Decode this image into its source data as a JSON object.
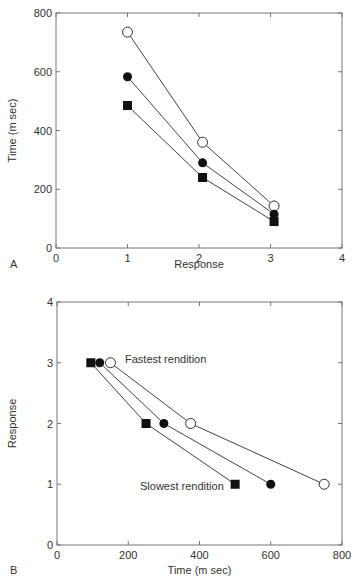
{
  "chart_data": [
    {
      "panel": "A",
      "type": "line",
      "xlabel": "Response",
      "ylabel": "Time (m sec)",
      "xlim": [
        0,
        4
      ],
      "ylim": [
        0,
        800
      ],
      "xticks": [
        "0",
        "1",
        "2",
        "3",
        "4"
      ],
      "yticks": [
        "0",
        "200",
        "400",
        "600",
        "800"
      ],
      "grid": false,
      "series": [
        {
          "name": "open-circle",
          "marker": "open-circle",
          "x": [
            1,
            2.05,
            3.05
          ],
          "y": [
            735,
            360,
            143
          ]
        },
        {
          "name": "filled-circle",
          "marker": "filled-circle",
          "x": [
            1,
            2.05,
            3.05
          ],
          "y": [
            583,
            290,
            115
          ]
        },
        {
          "name": "filled-square",
          "marker": "filled-square",
          "x": [
            1,
            2.05,
            3.05
          ],
          "y": [
            485,
            240,
            90
          ]
        }
      ]
    },
    {
      "panel": "B",
      "type": "line",
      "xlabel": "Time (m sec)",
      "ylabel": "Response",
      "xlim": [
        0,
        800
      ],
      "ylim": [
        0,
        4
      ],
      "xticks": [
        "0",
        "200",
        "400",
        "600",
        "800"
      ],
      "yticks": [
        "0",
        "1",
        "2",
        "3",
        "4"
      ],
      "grid": false,
      "annotations": [
        "Fastest rendition",
        "Slowest rendition"
      ],
      "series": [
        {
          "name": "filled-square",
          "marker": "filled-square",
          "x": [
            95,
            250,
            500
          ],
          "y": [
            3,
            2,
            1
          ]
        },
        {
          "name": "filled-circle",
          "marker": "filled-circle",
          "x": [
            120,
            300,
            600
          ],
          "y": [
            3,
            2,
            1
          ]
        },
        {
          "name": "open-circle",
          "marker": "open-circle",
          "x": [
            150,
            375,
            750
          ],
          "y": [
            3,
            2,
            1
          ]
        }
      ]
    }
  ],
  "labels": {
    "panelA": "A",
    "panelB": "B",
    "fastest": "Fastest rendition",
    "slowest": "Slowest rendition"
  }
}
